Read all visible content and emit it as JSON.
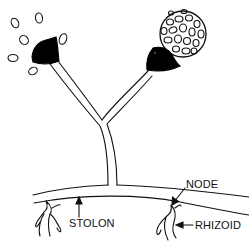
{
  "diagram": {
    "labels": {
      "stolon": "STOLON",
      "node": "NODE",
      "rhizoid": "RHIZOID"
    },
    "parts": [
      "released-spores",
      "columella-left",
      "sporangiophore-left",
      "sporangium-right",
      "columella-right",
      "sporangiophore-right",
      "stolon",
      "node",
      "rhizoid-left",
      "rhizoid-right"
    ],
    "colors": {
      "stroke": "#111111",
      "fill": "#000000",
      "background": "#ffffff"
    }
  }
}
